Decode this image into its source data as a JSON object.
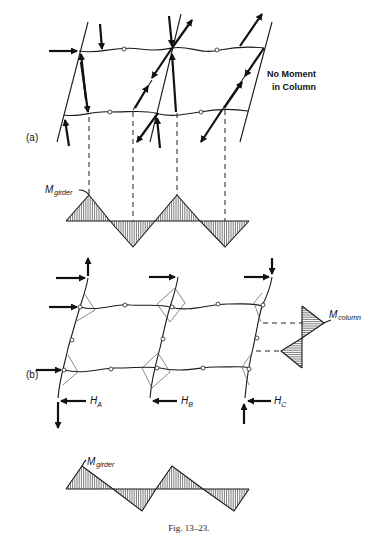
{
  "figure": {
    "caption": "Fig. 13–23.",
    "part_a": {
      "label": "(a)",
      "note_line1": "No Moment",
      "note_line2": "in Column",
      "moment_label_main": "M",
      "moment_label_sub": "girder"
    },
    "part_b": {
      "label": "(b)",
      "reaction_a_main": "H",
      "reaction_a_sub": "A",
      "reaction_b_main": "H",
      "reaction_b_sub": "B",
      "reaction_c_main": "H",
      "reaction_c_sub": "C",
      "column_moment_main": "M",
      "column_moment_sub": "column",
      "girder_moment_main": "M",
      "girder_moment_sub": "girder"
    }
  }
}
